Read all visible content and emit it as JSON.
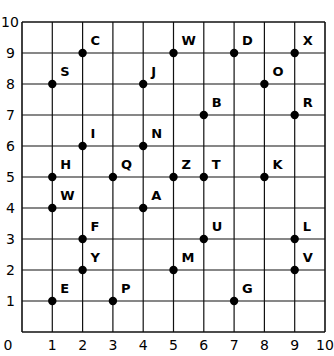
{
  "chart_data": {
    "type": "scatter",
    "title": "",
    "xlabel": "",
    "ylabel": "",
    "xlim": [
      0,
      10
    ],
    "ylim": [
      0,
      10
    ],
    "grid": true,
    "x_ticks": [
      "0",
      "1",
      "2",
      "3",
      "4",
      "5",
      "6",
      "7",
      "8",
      "9",
      "10"
    ],
    "y_ticks": [
      "1",
      "2",
      "3",
      "4",
      "5",
      "6",
      "7",
      "8",
      "9",
      "10"
    ],
    "points": [
      {
        "label": "C",
        "x": 2,
        "y": 9
      },
      {
        "label": "W",
        "x": 5,
        "y": 9
      },
      {
        "label": "D",
        "x": 7,
        "y": 9
      },
      {
        "label": "X",
        "x": 9,
        "y": 9
      },
      {
        "label": "S",
        "x": 1,
        "y": 8
      },
      {
        "label": "J",
        "x": 4,
        "y": 8
      },
      {
        "label": "O",
        "x": 8,
        "y": 8
      },
      {
        "label": "B",
        "x": 6,
        "y": 7
      },
      {
        "label": "R",
        "x": 9,
        "y": 7
      },
      {
        "label": "I",
        "x": 2,
        "y": 6
      },
      {
        "label": "N",
        "x": 4,
        "y": 6
      },
      {
        "label": "H",
        "x": 1,
        "y": 5
      },
      {
        "label": "Q",
        "x": 3,
        "y": 5
      },
      {
        "label": "Z",
        "x": 5,
        "y": 5
      },
      {
        "label": "T",
        "x": 6,
        "y": 5
      },
      {
        "label": "K",
        "x": 8,
        "y": 5
      },
      {
        "label": "W",
        "x": 1,
        "y": 4
      },
      {
        "label": "A",
        "x": 4,
        "y": 4
      },
      {
        "label": "F",
        "x": 2,
        "y": 3
      },
      {
        "label": "U",
        "x": 6,
        "y": 3
      },
      {
        "label": "L",
        "x": 9,
        "y": 3
      },
      {
        "label": "Y",
        "x": 2,
        "y": 2
      },
      {
        "label": "M",
        "x": 5,
        "y": 2
      },
      {
        "label": "V",
        "x": 9,
        "y": 2
      },
      {
        "label": "E",
        "x": 1,
        "y": 1
      },
      {
        "label": "P",
        "x": 3,
        "y": 1
      },
      {
        "label": "G",
        "x": 7,
        "y": 1
      }
    ]
  },
  "colors": {
    "line": "#111111",
    "point": "#000000",
    "text": "#000000"
  }
}
